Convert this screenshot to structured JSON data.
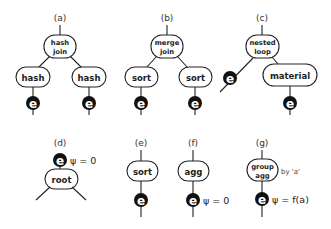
{
  "diagram": {
    "panels": [
      {
        "id": "a",
        "label": "(a)",
        "root_node": {
          "line1": "hash",
          "line2": "join"
        },
        "children": [
          {
            "label": "hash",
            "leaf": "e"
          },
          {
            "label": "hash",
            "leaf": "e"
          }
        ]
      },
      {
        "id": "b",
        "label": "(b)",
        "root_node": {
          "line1": "merge",
          "line2": "join"
        },
        "children": [
          {
            "label": "sort",
            "leaf": "e"
          },
          {
            "label": "sort",
            "leaf": "e"
          }
        ]
      },
      {
        "id": "c",
        "label": "(c)",
        "root_node": {
          "line1": "nested",
          "line2": "loop"
        },
        "children": [
          {
            "leaf": "e"
          },
          {
            "label": "material",
            "leaf": "e"
          }
        ]
      },
      {
        "id": "d",
        "label": "(d)",
        "leaf": "e",
        "annotation": "ψ = 0",
        "node": "root"
      },
      {
        "id": "e",
        "label": "(e)",
        "node": "sort",
        "leaf": "e"
      },
      {
        "id": "f",
        "label": "(f)",
        "node": "agg",
        "leaf": "e",
        "annotation": "ψ = 0"
      },
      {
        "id": "g",
        "label": "(g)",
        "node": {
          "line1": "group",
          "line2": "agg"
        },
        "node_note": "by 'a'",
        "leaf": "e",
        "annotation": "ψ = f(a)"
      }
    ],
    "colors": {
      "stroke": "#222222",
      "leaf_fill": "#111111",
      "leaf_text": "#ffffff",
      "background": "#ffffff"
    }
  }
}
